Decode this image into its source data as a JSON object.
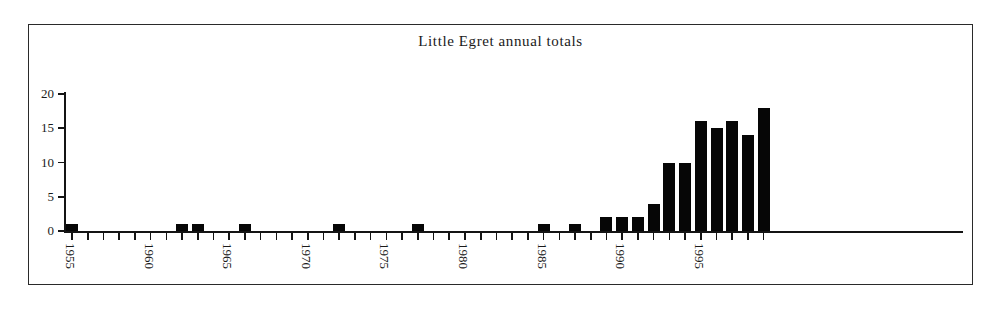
{
  "figure": {
    "title": "Little Egret annual totals",
    "frame_color": "#2a2a2a",
    "axis_color": "#141414",
    "bar_color": "#060606",
    "background": "#ffffff"
  },
  "chart_data": {
    "type": "bar",
    "title": "Little Egret annual totals",
    "xlabel": "",
    "ylabel": "",
    "ylim": [
      0,
      20
    ],
    "yticks": [
      0,
      5,
      10,
      15,
      20
    ],
    "ytick_labels": [
      "0",
      "5",
      "10",
      "15",
      "20"
    ],
    "xtick_labels": [
      "1955",
      "1960",
      "1965",
      "1970",
      "1975",
      "1980",
      "1985",
      "1990",
      "1995"
    ],
    "xtick_label_rotation": 90,
    "grid": false,
    "legend": false,
    "categories": [
      "1955",
      "1956",
      "1957",
      "1958",
      "1959",
      "1960",
      "1961",
      "1962",
      "1963",
      "1964",
      "1965",
      "1966",
      "1967",
      "1968",
      "1969",
      "1970",
      "1971",
      "1972",
      "1973",
      "1974",
      "1975",
      "1976",
      "1977",
      "1978",
      "1979",
      "1980",
      "1981",
      "1982",
      "1983",
      "1984",
      "1985",
      "1986",
      "1987",
      "1988",
      "1989",
      "1990",
      "1991",
      "1992",
      "1993",
      "1994",
      "1995",
      "1996",
      "1997",
      "1998",
      "1999"
    ],
    "values": [
      1,
      0,
      0,
      0,
      0,
      0,
      0,
      1,
      1,
      0,
      0,
      1,
      0,
      0,
      0,
      0,
      0,
      1,
      0,
      0,
      0,
      0,
      1,
      0,
      0,
      0,
      0,
      0,
      0,
      0,
      1,
      0,
      1,
      0,
      2,
      2,
      2,
      4,
      10,
      10,
      16,
      15,
      16,
      14,
      18
    ]
  }
}
